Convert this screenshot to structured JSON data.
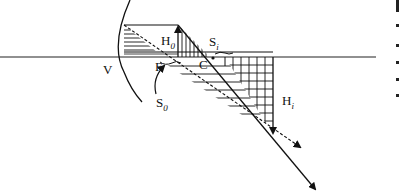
{
  "diagram": {
    "labels": {
      "vertex": "V",
      "focal_point": "F",
      "center_of_curvature": "C",
      "object_height": "H",
      "object_height_sub": "0",
      "image_height": "H",
      "image_height_sub": "i",
      "object_distance": "S",
      "object_distance_sub": "0",
      "image_distance": "S",
      "image_distance_sub": "i"
    },
    "colors": {
      "line": "#111111",
      "background": "#ffffff"
    }
  }
}
